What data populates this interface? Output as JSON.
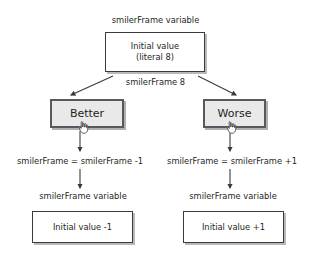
{
  "diagram": {
    "labels": {
      "top_variable": "smilerFrame variable",
      "middle_value": "smilerFrame 8",
      "equation_left": "smilerFrame = smilerFrame -1",
      "equation_right": "smilerFrame = smilerFrame +1",
      "variable_left": "smilerFrame variable",
      "variable_right": "smilerFrame variable"
    },
    "boxes": {
      "initial_line1": "Initial value",
      "initial_line2": "(literal 8)",
      "result_left": "Initial value -1",
      "result_right": "Initial value +1"
    },
    "buttons": {
      "better": "Better",
      "worse": "Worse"
    },
    "icons": {
      "cursor_better": "hand-cursor-icon",
      "cursor_worse": "hand-cursor-icon"
    },
    "colors": {
      "button_fill": "#e9e9e9",
      "button_border": "#58595b",
      "box_border": "#3b3b3b",
      "shadow": "#b9b9b9",
      "text": "#231f20",
      "background": "#ffffff"
    }
  }
}
